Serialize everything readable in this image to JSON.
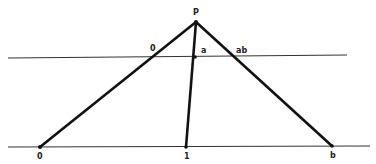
{
  "diagram": {
    "apex_label": "P",
    "upper_line": {
      "labels": {
        "zero": "0",
        "a": "a",
        "ab": "ab"
      }
    },
    "lower_line": {
      "labels": {
        "zero": "0",
        "one": "1",
        "b": "b"
      }
    },
    "colors": {
      "line": "#111111",
      "thin_line": "#333333",
      "background": "#ffffff"
    }
  }
}
